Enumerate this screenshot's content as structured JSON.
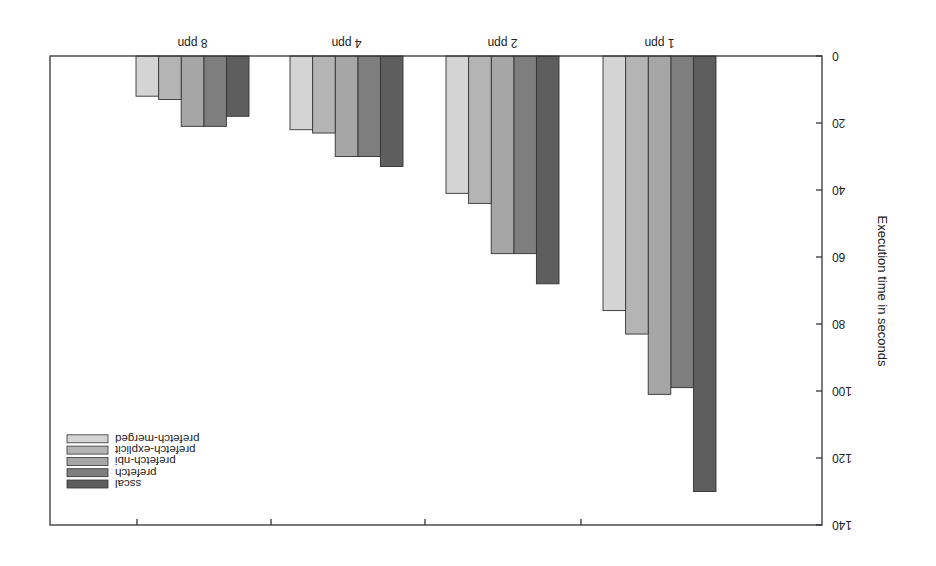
{
  "chart_data": {
    "type": "bar",
    "title": "",
    "xlabel": "",
    "ylabel": "Execution time in seconds",
    "ylim": [
      0,
      140
    ],
    "yticks": [
      0,
      20,
      40,
      60,
      80,
      100,
      120,
      140
    ],
    "grid": false,
    "legend_position": "upper right (image is rotated 180°)",
    "orientation_note": "Figure rendered rotated 180 degrees",
    "categories": [
      "1 ppn",
      "2 ppn",
      "4 ppn",
      "8 ppn"
    ],
    "series": [
      {
        "name": "sscal",
        "color": "#5e5e5e",
        "values": [
          130,
          68,
          33,
          18
        ]
      },
      {
        "name": "prefetch",
        "color": "#7e7e7e",
        "values": [
          99,
          59,
          30,
          21
        ]
      },
      {
        "name": "prefetch-nbi",
        "color": "#a6a6a6",
        "values": [
          101,
          59,
          30,
          21
        ]
      },
      {
        "name": "prefetch-explicit",
        "color": "#b4b4b4",
        "values": [
          83,
          44,
          23,
          13
        ]
      },
      {
        "name": "prefetch-merged",
        "color": "#d4d4d4",
        "values": [
          76,
          41,
          22,
          12
        ]
      }
    ]
  }
}
